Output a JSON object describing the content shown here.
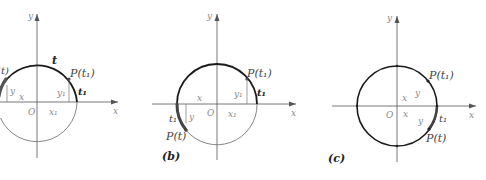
{
  "figure": {
    "panels": [
      {
        "id": "a",
        "caption": "",
        "axis_labels": {
          "x": "x",
          "y": "y",
          "origin": "O"
        },
        "labels": {
          "arc": "t",
          "point_t1": "P(t₁)",
          "arc_t1": "t₁",
          "y1": "y₁",
          "x1": "x₁",
          "y": "y",
          "x": "x",
          "point_t_partial": "(t)"
        }
      },
      {
        "id": "b",
        "caption": "(b)",
        "axis_labels": {
          "x": "x",
          "y": "y",
          "origin": "O"
        },
        "labels": {
          "point_t1": "P(t₁)",
          "arc_t1": "t₁",
          "y1": "y₁",
          "x1": "x₁",
          "x": "x",
          "y": "y",
          "arc_t1_lower": "t₁",
          "point_t": "P(t)"
        }
      },
      {
        "id": "c",
        "caption": "(c)",
        "axis_labels": {
          "x": "x",
          "y": "y",
          "origin": "O"
        },
        "labels": {
          "point_t1": "P(t₁)",
          "x_upper": "x",
          "y_upper": "y",
          "x_lower": "x",
          "y_lower": "y",
          "arc_t1": "t₁",
          "point_t": "P(t)"
        }
      }
    ],
    "colors": {
      "axis": "#555555",
      "circle_thin": "#777777",
      "circle_bold": "#1a1a1a",
      "arc_highlight": "#555555"
    }
  }
}
